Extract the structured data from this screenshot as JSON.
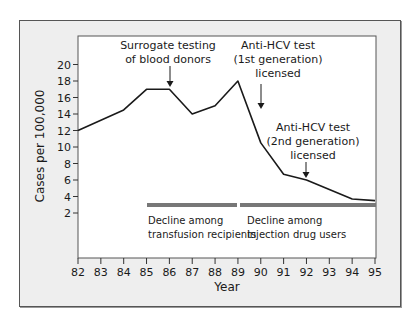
{
  "chart_data": {
    "type": "line",
    "title": "",
    "xlabel": "Year",
    "ylabel": "Cases per 100,000",
    "x": [
      82,
      83,
      84,
      85,
      86,
      87,
      88,
      89,
      90,
      91,
      92,
      93,
      94,
      95
    ],
    "series": [
      {
        "name": "Acute hepatitis C incidence",
        "points": [
          {
            "x": 82,
            "y": 12
          },
          {
            "x": 84,
            "y": 14.5
          },
          {
            "x": 85,
            "y": 17
          },
          {
            "x": 86,
            "y": 17
          },
          {
            "x": 87,
            "y": 14
          },
          {
            "x": 88,
            "y": 15
          },
          {
            "x": 89,
            "y": 18
          },
          {
            "x": 90,
            "y": 10.5
          },
          {
            "x": 91,
            "y": 6.7
          },
          {
            "x": 92,
            "y": 6
          },
          {
            "x": 94,
            "y": 3.7
          },
          {
            "x": 95,
            "y": 3.5
          }
        ]
      }
    ],
    "xticks": [
      "82",
      "83",
      "84",
      "85",
      "86",
      "87",
      "88",
      "89",
      "90",
      "91",
      "92",
      "93",
      "94",
      "95"
    ],
    "yticks": [
      "2",
      "4",
      "6",
      "8",
      "10",
      "12",
      "14",
      "16",
      "18",
      "20"
    ],
    "xlim": [
      82,
      95
    ],
    "ylim": [
      0,
      20
    ],
    "grid": false,
    "legend": "none",
    "annotations": [
      {
        "text": [
          "Surrogate testing",
          "of blood donors"
        ],
        "arrow_x": 86
      },
      {
        "text": [
          "Anti-HCV test",
          "(1st generation)",
          "licensed"
        ],
        "arrow_x": 90
      },
      {
        "text": [
          "Anti-HCV test",
          "(2nd generation)",
          "licensed"
        ],
        "arrow_x": 92
      }
    ],
    "periods": [
      {
        "label": [
          "Decline among",
          "transfusion recipients"
        ],
        "from": 85,
        "to": 89
      },
      {
        "label": [
          "Decline among",
          "injection drug users"
        ],
        "from": 89,
        "to": 95
      }
    ]
  },
  "labels": {
    "ylabel": "Cases per 100,000",
    "xlabel": "Year",
    "ann1_l1": "Surrogate testing",
    "ann1_l2": "of blood donors",
    "ann2_l1": "Anti-HCV test",
    "ann2_l2": "(1st generation)",
    "ann2_l3": "licensed",
    "ann3_l1": "Anti-HCV test",
    "ann3_l2": "(2nd generation)",
    "ann3_l3": "licensed",
    "period1_l1": "Decline among",
    "period1_l2": "transfusion recipients",
    "period2_l1": "Decline among",
    "period2_l2": "injection drug users"
  },
  "colors": {
    "frame_bg": "#eeeeee",
    "plot_bg": "#ffffff",
    "line": "#1a1a1a",
    "period_bar": "#777777"
  }
}
